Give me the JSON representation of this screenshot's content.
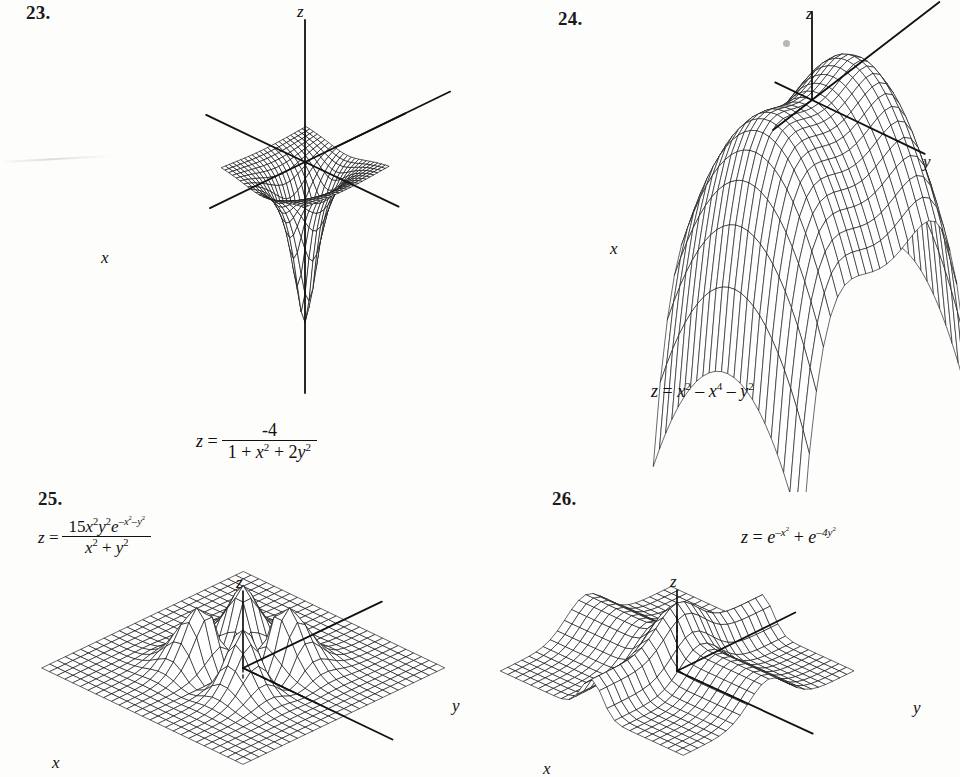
{
  "page": {
    "background": "#fdfdfc",
    "ink": "#111111",
    "width": 960,
    "height": 777
  },
  "figures": [
    {
      "id": "fig-23",
      "number": "23.",
      "axis_labels": {
        "x": "x",
        "y": "y",
        "z": "z"
      },
      "formula_plain": "z = -4 / (1 + x^2 + 2y^2)",
      "formula": {
        "lead": "z =",
        "numerator": "-4",
        "denominator_parts": [
          "1 + ",
          "x",
          "2",
          " + 2",
          "y",
          "2"
        ]
      },
      "chart_data": {
        "type": "surface",
        "title": "",
        "expression": "z = -4/(1 + x^2 + 2y^2)",
        "xlabel": "x",
        "ylabel": "y",
        "zlabel": "z",
        "xlim": [
          -3,
          3
        ],
        "ylim": [
          -3,
          3
        ],
        "zlim": [
          -4,
          0
        ],
        "grid": true,
        "mesh_u": 22,
        "mesh_v": 22,
        "description": "Bell-shaped well dipping to -4 at the origin, flattening to 0 far away"
      }
    },
    {
      "id": "fig-24",
      "number": "24.",
      "axis_labels": {
        "x": "x",
        "y": "y",
        "z": "z"
      },
      "formula_plain": "z = x^2 - x^4 - y^2",
      "formula": {
        "lead": "z =",
        "terms": [
          "x",
          "2",
          " − ",
          "x",
          "4",
          " − ",
          "y",
          "2"
        ]
      },
      "chart_data": {
        "type": "surface",
        "title": "",
        "expression": "z = x^2 - x^4 - y^2",
        "xlabel": "x",
        "ylabel": "y",
        "zlabel": "z",
        "xlim": [
          -1.6,
          1.6
        ],
        "ylim": [
          -1.6,
          1.6
        ],
        "zlim": [
          -8,
          0.3
        ],
        "grid": true,
        "mesh_u": 22,
        "mesh_v": 22,
        "description": "Saddle/monkey-like ridge with two humps at x = +-0.707 and steep downward tails"
      }
    },
    {
      "id": "fig-25",
      "number": "25.",
      "axis_labels": {
        "x": "x",
        "y": "y",
        "z": "z"
      },
      "formula_plain": "z = 15x^2 y^2 e^(-x^2-y^2) / (x^2 + y^2)",
      "formula": {
        "lead": "z =",
        "numerator_parts": [
          "15",
          "x",
          "2",
          "y",
          "2",
          "e",
          "-x²-y²"
        ],
        "denominator_parts": [
          "x",
          "2",
          " + ",
          "y",
          "2"
        ]
      },
      "chart_data": {
        "type": "surface",
        "title": "",
        "expression": "z = 15x^2y^2e^(-x^2-y^2)/(x^2+y^2)",
        "xlabel": "x",
        "ylabel": "y",
        "zlabel": "z",
        "xlim": [
          -3.2,
          3.2
        ],
        "ylim": [
          -3.2,
          3.2
        ],
        "zlim": [
          0,
          3
        ],
        "grid": true,
        "mesh_u": 26,
        "mesh_v": 26,
        "description": "Flat sheet with four symmetric peaks arranged around the origin, zero along both axes"
      }
    },
    {
      "id": "fig-26",
      "number": "26.",
      "axis_labels": {
        "x": "x",
        "y": "y",
        "z": "z"
      },
      "formula_plain": "z = e^(-x^2) + e^(-4y^2)",
      "formula": {
        "lead": "z =",
        "terms": [
          "e",
          "-x²",
          " + ",
          "e",
          "-4y²"
        ]
      },
      "chart_data": {
        "type": "surface",
        "title": "",
        "expression": "z = e^(-x^2) + e^(-4y^2)",
        "xlabel": "x",
        "ylabel": "y",
        "zlabel": "z",
        "xlim": [
          -3,
          3
        ],
        "ylim": [
          -3,
          3
        ],
        "zlim": [
          0,
          2
        ],
        "grid": true,
        "mesh_u": 24,
        "mesh_v": 24,
        "description": "Two crossed ridges summing to a central peak of height 2"
      }
    }
  ]
}
